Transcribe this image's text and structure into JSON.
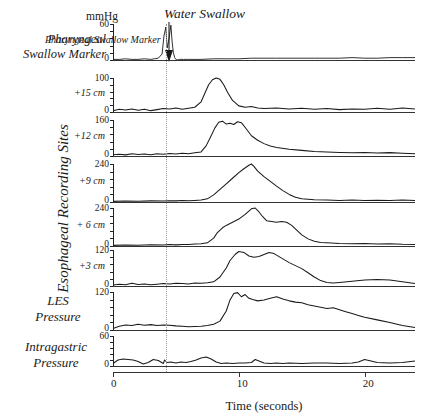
{
  "units_label": "mmHg",
  "annotation": {
    "water_swallow": "Water Swallow",
    "arrow": "down-arrow-icon"
  },
  "group_label": "Esophageal Recording Sites",
  "axis": {
    "x_title": "Time (seconds)",
    "x_ticks": [
      "0",
      "10",
      "20"
    ],
    "x_values": [
      0,
      10,
      20
    ],
    "x_range": [
      0,
      24
    ]
  },
  "rows": [
    {
      "name": "pharyngeal",
      "label": "Pharyngeal\nSwallow Marker",
      "label_line1": "Pharyngeal",
      "label_line2": "Swallow Marker",
      "ymax": "60",
      "ymin": "0"
    },
    {
      "name": "plus15",
      "label": "+15 cm",
      "ymax": "100",
      "ymin": "0"
    },
    {
      "name": "plus12",
      "label": "+12 cm",
      "ymax": "160",
      "ymin": "0"
    },
    {
      "name": "plus9",
      "label": "+9 cm",
      "ymax": "240",
      "ymin": "0"
    },
    {
      "name": "plus6",
      "label": "+ 6 cm",
      "ymax": "240",
      "ymin": "0"
    },
    {
      "name": "plus3",
      "label": "+3 cm",
      "ymax": "120",
      "ymin": "0"
    },
    {
      "name": "les",
      "label_line1": "LES",
      "label_line2": "Pressure",
      "ymax": "120",
      "ymin": "0"
    },
    {
      "name": "intragastric",
      "label_line1": "Intragastric",
      "label_line2": "Pressure",
      "ymax": "60",
      "ymin": "0"
    }
  ],
  "chart_data": {
    "type": "line",
    "xlabel": "Time (seconds)",
    "ylabel": "mmHg",
    "xlim": [
      0,
      24
    ],
    "grid": false,
    "legend": "none",
    "annotations": [
      {
        "text": "Water Swallow",
        "x": 4.2,
        "marker": "down-arrow"
      }
    ],
    "series": [
      {
        "name": "Pharyngeal Swallow Marker",
        "ylim": [
          0,
          60
        ],
        "yticks": [
          0,
          60
        ],
        "x": [
          0,
          0.5,
          1,
          1.5,
          2,
          2.5,
          3,
          3.3,
          3.6,
          3.9,
          4.05,
          4.2,
          4.3,
          4.45,
          4.6,
          4.7,
          4.8,
          4.9,
          5.0,
          5.1,
          5.3,
          5.6,
          6,
          7,
          8,
          9,
          10,
          11,
          12,
          13,
          14,
          15,
          16,
          17,
          18,
          19,
          20,
          21,
          22,
          23,
          24
        ],
        "y": [
          1,
          1,
          2,
          1,
          1,
          2,
          1,
          2,
          3,
          10,
          40,
          55,
          20,
          35,
          58,
          30,
          12,
          4,
          1,
          0,
          1,
          1,
          1,
          1,
          2,
          2,
          2,
          3,
          3,
          3,
          3,
          3,
          3,
          3,
          3,
          4,
          3,
          3,
          4,
          4,
          4
        ]
      },
      {
        "name": "+15 cm",
        "ylim": [
          0,
          100
        ],
        "yticks": [
          0,
          100
        ],
        "x": [
          0,
          0.5,
          1,
          1.5,
          2,
          2.5,
          3,
          3.5,
          4,
          4.5,
          5,
          5.5,
          6,
          6.5,
          7,
          7.3,
          7.6,
          7.9,
          8.2,
          8.5,
          8.8,
          9.1,
          9.5,
          10,
          10.5,
          11,
          11.5,
          12,
          13,
          14,
          15,
          16,
          17,
          18,
          19,
          20,
          21,
          22,
          23,
          24
        ],
        "y": [
          4,
          8,
          6,
          9,
          5,
          8,
          4,
          7,
          10,
          9,
          12,
          8,
          11,
          14,
          30,
          55,
          80,
          95,
          100,
          96,
          80,
          58,
          34,
          18,
          14,
          16,
          12,
          10,
          12,
          9,
          11,
          8,
          10,
          7,
          9,
          8,
          11,
          8,
          12,
          9
        ]
      },
      {
        "name": "+12 cm",
        "ylim": [
          0,
          160
        ],
        "yticks": [
          0,
          160
        ],
        "x": [
          0,
          0.5,
          1,
          1.5,
          2,
          2.5,
          3,
          3.5,
          4,
          4.5,
          5,
          5.5,
          6,
          6.5,
          7,
          7.4,
          7.8,
          8.1,
          8.4,
          8.7,
          9,
          9.3,
          9.6,
          9.9,
          10.2,
          10.6,
          11,
          11.5,
          12,
          12.5,
          13,
          14,
          15,
          16,
          17,
          18,
          19,
          20,
          21,
          22,
          23,
          24
        ],
        "y": [
          6,
          8,
          5,
          10,
          7,
          9,
          6,
          10,
          8,
          11,
          9,
          12,
          10,
          14,
          18,
          45,
          90,
          125,
          150,
          155,
          142,
          146,
          140,
          152,
          148,
          120,
          90,
          70,
          55,
          44,
          38,
          30,
          25,
          20,
          18,
          16,
          14,
          16,
          13,
          15,
          12,
          10
        ]
      },
      {
        "name": "+9 cm",
        "ylim": [
          0,
          240
        ],
        "yticks": [
          0,
          240
        ],
        "x": [
          0,
          1,
          2,
          3,
          4,
          4.5,
          5,
          5.5,
          6,
          6.5,
          7,
          7.5,
          8,
          8.5,
          9,
          9.5,
          10,
          10.4,
          10.8,
          11,
          11.2,
          11.5,
          12,
          12.5,
          13,
          13.5,
          14,
          14.5,
          15,
          16,
          17,
          18,
          19,
          20,
          21,
          22,
          23,
          24
        ],
        "y": [
          4,
          6,
          5,
          7,
          6,
          8,
          7,
          9,
          8,
          10,
          12,
          20,
          45,
          80,
          115,
          150,
          185,
          210,
          232,
          240,
          225,
          195,
          160,
          130,
          100,
          72,
          48,
          30,
          20,
          14,
          12,
          10,
          12,
          9,
          11,
          10,
          12,
          9
        ]
      },
      {
        "name": "+ 6 cm",
        "ylim": [
          0,
          240
        ],
        "yticks": [
          0,
          240
        ],
        "x": [
          0,
          1,
          2,
          3,
          4,
          4.5,
          5,
          5.5,
          6,
          6.5,
          7,
          7.5,
          8,
          8.3,
          8.7,
          9,
          9.5,
          10,
          10.5,
          11,
          11.3,
          11.6,
          11.9,
          12.2,
          12.6,
          13,
          13.4,
          13.8,
          14.2,
          14.6,
          15,
          15.5,
          16,
          16.5,
          17,
          18,
          19,
          20,
          21,
          22,
          23,
          24
        ],
        "y": [
          4,
          6,
          5,
          8,
          6,
          9,
          7,
          10,
          9,
          12,
          14,
          20,
          50,
          85,
          115,
          130,
          150,
          170,
          200,
          235,
          240,
          215,
          185,
          160,
          155,
          150,
          155,
          150,
          130,
          100,
          70,
          45,
          30,
          22,
          20,
          16,
          14,
          16,
          12,
          14,
          11,
          10
        ]
      },
      {
        "name": "+3 cm",
        "ylim": [
          0,
          120
        ],
        "yticks": [
          0,
          120
        ],
        "x": [
          0,
          0.5,
          1,
          1.5,
          2,
          2.5,
          3,
          3.5,
          4,
          4.5,
          5,
          5.5,
          6,
          6.5,
          7,
          7.5,
          8,
          8.5,
          9,
          9.3,
          9.7,
          10,
          10.4,
          10.8,
          11.2,
          11.6,
          12,
          12.4,
          12.8,
          13.2,
          13.6,
          14,
          14.5,
          15,
          15.5,
          16,
          16.5,
          17,
          17.5,
          18,
          19,
          20,
          21,
          22,
          23,
          24
        ],
        "y": [
          3,
          6,
          4,
          9,
          5,
          7,
          4,
          6,
          8,
          7,
          9,
          8,
          7,
          10,
          9,
          11,
          14,
          30,
          60,
          85,
          105,
          115,
          112,
          100,
          96,
          98,
          105,
          112,
          108,
          98,
          88,
          78,
          68,
          58,
          44,
          30,
          18,
          12,
          10,
          12,
          16,
          20,
          22,
          20,
          14,
          8
        ]
      },
      {
        "name": "LES Pressure",
        "ylim": [
          0,
          120
        ],
        "yticks": [
          0,
          120
        ],
        "x": [
          0,
          0.5,
          1,
          1.5,
          2,
          2.5,
          3,
          3.5,
          4,
          4.5,
          5,
          5.5,
          6,
          6.5,
          7,
          7.5,
          8,
          8.5,
          9,
          9.3,
          9.6,
          9.9,
          10.2,
          10.5,
          10.8,
          11.1,
          11.5,
          12,
          12.5,
          13,
          13.5,
          14,
          14.5,
          15,
          15.5,
          16,
          16.5,
          17,
          17.5,
          18,
          18.5,
          19,
          19.5,
          20,
          21,
          22,
          23,
          24
        ],
        "y": [
          5,
          12,
          16,
          14,
          18,
          15,
          17,
          14,
          16,
          15,
          13,
          12,
          10,
          11,
          12,
          14,
          18,
          28,
          60,
          95,
          115,
          118,
          105,
          112,
          100,
          96,
          92,
          95,
          100,
          105,
          98,
          92,
          88,
          86,
          80,
          76,
          72,
          68,
          70,
          64,
          58,
          52,
          46,
          40,
          32,
          24,
          14,
          8
        ]
      },
      {
        "name": "Intragastric Pressure",
        "ylim": [
          0,
          60
        ],
        "yticks": [
          0,
          60
        ],
        "x": [
          0,
          0.4,
          0.8,
          1.2,
          1.6,
          2,
          2.4,
          2.8,
          3.2,
          3.6,
          4,
          4.1,
          4.3,
          4.6,
          5,
          5.4,
          5.8,
          6.2,
          6.6,
          7,
          7.4,
          7.8,
          8.2,
          8.6,
          9,
          9.5,
          10,
          10.5,
          11,
          11.3,
          11.7,
          12,
          12.5,
          13,
          13.5,
          14,
          15,
          16,
          17,
          18,
          19,
          19.5,
          20,
          20.5,
          21,
          22,
          23,
          24
        ],
        "y": [
          5,
          12,
          14,
          13,
          12,
          9,
          4,
          7,
          13,
          11,
          5,
          12,
          7,
          8,
          6,
          8,
          7,
          9,
          12,
          16,
          18,
          14,
          8,
          5,
          6,
          5,
          6,
          6,
          7,
          13,
          9,
          6,
          5,
          6,
          5,
          6,
          5,
          6,
          6,
          5,
          6,
          8,
          13,
          10,
          7,
          6,
          7,
          10
        ]
      }
    ]
  }
}
